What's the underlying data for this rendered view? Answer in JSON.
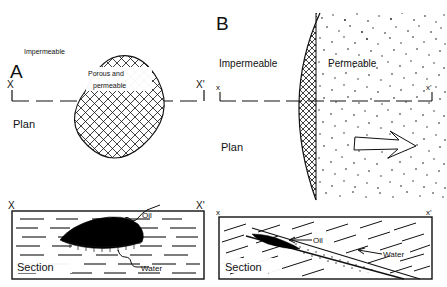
{
  "figure": {
    "type": "geologic-trap-diagram",
    "panels": [
      {
        "id": "A",
        "letter": "A",
        "plan": {
          "view_label": "Plan",
          "surrounding_label": "Impermeable",
          "body_label_line1": "Porous  and",
          "body_label_line2": "permeable",
          "section_line_left": "X",
          "section_line_right": "X'",
          "body_shape": "oval-lens",
          "body_pattern": "crosshatch"
        },
        "section": {
          "view_label": "Section",
          "left_mark": "X",
          "right_mark": "X'",
          "callouts": [
            {
              "label": "Oil",
              "target": "black-lens-top",
              "leader": "wavy"
            },
            {
              "label": "Water",
              "target": "lens-base",
              "leader": "wavy"
            }
          ],
          "matrix_pattern": "horizontal-dashes",
          "oil_fill": "#000000"
        }
      },
      {
        "id": "B",
        "letter": "B",
        "plan": {
          "view_label": "Plan",
          "left_zone_label": "Impermeable",
          "right_zone_label": "Permeable",
          "section_line_left": "x",
          "section_line_right": "x'",
          "boundary_pattern": "crosshatch-crescent",
          "right_zone_pattern": "stipple",
          "flow_arrow": {
            "direction": "right",
            "style": "open-outline"
          }
        },
        "section": {
          "view_label": "Section",
          "left_mark": "x",
          "right_mark": "x'",
          "callouts": [
            {
              "label": "Oil",
              "target": "black-lens",
              "leader": "straight-arrow"
            },
            {
              "label": "Water",
              "target": "stippled-band",
              "leader": "straight-arrow"
            }
          ],
          "matrix_pattern": "inclined-dashes",
          "band_pattern": "stipple",
          "oil_fill": "#000000"
        }
      }
    ]
  },
  "colors": {
    "ink": "#111111",
    "paper": "#ffffff",
    "oil": "#000000"
  }
}
